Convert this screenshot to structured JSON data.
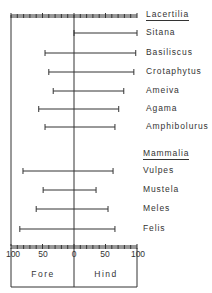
{
  "chart_data": {
    "type": "bar",
    "subtype": "diverging-range",
    "title": "",
    "xlabel_left": "Fore",
    "xlabel_right": "Hind",
    "xlim": [
      -100,
      100
    ],
    "xticks": [
      "100",
      "50",
      "0",
      "50",
      "100"
    ],
    "grid": false,
    "groups": [
      {
        "name": "Lacertilia",
        "items": [
          {
            "label": "Sitana",
            "fore": 0,
            "hind": 100
          },
          {
            "label": "Basiliscus",
            "fore": 46,
            "hind": 98
          },
          {
            "label": "Crotaphytus",
            "fore": 40,
            "hind": 95
          },
          {
            "label": "Ameiva",
            "fore": 33,
            "hind": 79
          },
          {
            "label": "Agama",
            "fore": 56,
            "hind": 71
          },
          {
            "label": "Amphibolurus",
            "fore": 46,
            "hind": 65
          }
        ]
      },
      {
        "name": "Mammalia",
        "items": [
          {
            "label": "Vulpes",
            "fore": 81,
            "hind": 62
          },
          {
            "label": "Mustela",
            "fore": 49,
            "hind": 35
          },
          {
            "label": "Meles",
            "fore": 60,
            "hind": 54
          },
          {
            "label": "Felis",
            "fore": 86,
            "hind": 65
          }
        ]
      }
    ]
  },
  "labels": {
    "group1": "Lacertilia",
    "group2": "Mammalia",
    "fore": "Fore",
    "hind": "Hind"
  },
  "colors": {
    "ink": "#333333",
    "background": "#ffffff"
  }
}
